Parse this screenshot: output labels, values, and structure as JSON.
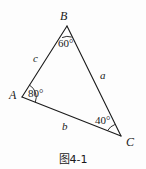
{
  "figure": {
    "caption": "图4-1",
    "type": "triangle-diagram",
    "background_color": "#fdfdfd",
    "stroke_color": "#1a1a1a",
    "vertices": [
      {
        "name": "A",
        "label": "A",
        "x": 22,
        "y": 97
      },
      {
        "name": "B",
        "label": "B",
        "x": 67,
        "y": 26
      },
      {
        "name": "C",
        "label": "C",
        "x": 121,
        "y": 136
      }
    ],
    "sides": [
      {
        "name": "a",
        "label": "a",
        "between": "B-C"
      },
      {
        "name": "b",
        "label": "b",
        "between": "A-C"
      },
      {
        "name": "c",
        "label": "c",
        "between": "A-B"
      }
    ],
    "angles": [
      {
        "at": "A",
        "label": "80°",
        "value": 80
      },
      {
        "at": "B",
        "label": "60°",
        "value": 60
      },
      {
        "at": "C",
        "label": "40°",
        "value": 40
      }
    ]
  },
  "labels": {
    "vertex_a": "A",
    "vertex_b": "B",
    "vertex_c": "C",
    "side_a": "a",
    "side_b": "b",
    "side_c": "c",
    "angle_a": "80°",
    "angle_b": "60°",
    "angle_c": "40°",
    "caption": "图4-1"
  }
}
